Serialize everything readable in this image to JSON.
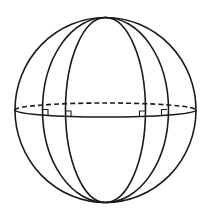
{
  "diagram": {
    "type": "sphere-with-meridians",
    "colors": {
      "line": "#1a1a1a",
      "background": "#ffffff"
    },
    "sphere": {
      "center": [
        105.5,
        110
      ],
      "radius_x": 90.5,
      "radius_y": 92.5
    },
    "equator": {
      "front": "solid",
      "back": "dashed",
      "half_height": 7
    },
    "meridians": [
      {
        "name": "outer",
        "half_width": 63
      },
      {
        "name": "inner",
        "half_width": 40
      }
    ],
    "right_angle_markers": [
      {
        "x": 42,
        "y": 115
      },
      {
        "x": 65,
        "y": 116.5
      },
      {
        "x": 145,
        "y": 116.5
      },
      {
        "x": 167,
        "y": 115
      }
    ],
    "labels": []
  }
}
